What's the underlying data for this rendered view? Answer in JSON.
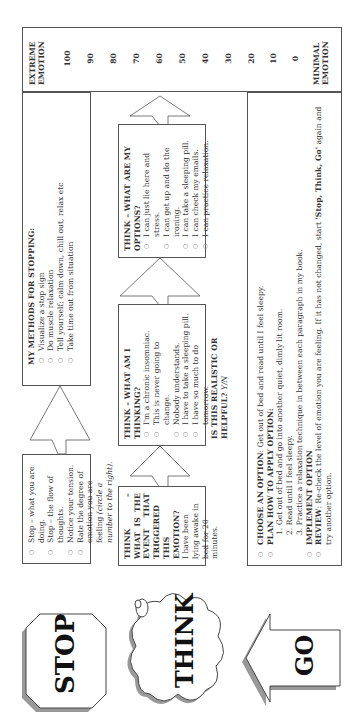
{
  "stop": {
    "label": "STOP",
    "items": [
      "Stop – what you are doing.",
      "Stop – the flow of thoughts.",
      "Notice your tension.",
      "Rate the degree of emotion you are feeling "
    ],
    "rate_note": "(circle a number to the right)."
  },
  "methods": {
    "title": "MY METHODS FOR STOPPING:",
    "items": [
      "Visualize a stop sign",
      "Do muscle relaxation",
      "Tell yourself; calm down, chill out, relax etc",
      "Take time out from situation"
    ]
  },
  "think": {
    "label": "THINK",
    "event": {
      "title": "THINK – WHAT IS THE EVENT THAT TRIGGERED THIS EMOTION?",
      "text": "I have been lying awake in bed for 20 minutes."
    },
    "thinking": {
      "title": "THINK – WHAT AM I THINKING?",
      "items": [
        "I'm a chronic insomniac.",
        "This is never going to change.",
        "Nobody understands.",
        "I have to take a sleeping pill.",
        "I have so much to do tomorrow."
      ],
      "question": "IS THIS REALISTIC OR HELPFUL?",
      "answer": "Y/N"
    },
    "options": {
      "title": "THINK – WHAT ARE MY OPTIONS?",
      "items": [
        "I can just lie here and stress.",
        "I can get up and do the ironing.",
        "I can take a sleeping pill.",
        "I can check my emails.",
        "I can practice relaxation."
      ]
    }
  },
  "go": {
    "label": "GO",
    "choose_label": "CHOOSE AN OPTION",
    "choose_text": ": Get out of bed and read until I feel sleepy.",
    "plan_label": "PLAN HOW TO APPLY OPTION:",
    "plan_steps": [
      "1. Get out of bed and go into another quiet, dimly lit room.",
      "2. Read until I feel sleepy.",
      "3. Practice a relaxation technique in between each paragraph in my book."
    ],
    "implement_label": "IMPLEMENT OPTION",
    "review_label": "REVIEW",
    "review_text": ": Re-check the level of emotion you are feeling. If it has not changed, start ",
    "review_bold": "'Stop, Think, Go'",
    "review_tail": " again and try another option."
  },
  "scale": {
    "top_label": "EXTREME EMOTION",
    "bottom_label": "MINIMAL EMOTION",
    "values": [
      "100",
      "90",
      "80",
      "70",
      "60",
      "50",
      "40",
      "30",
      "20",
      "10",
      "0"
    ]
  }
}
